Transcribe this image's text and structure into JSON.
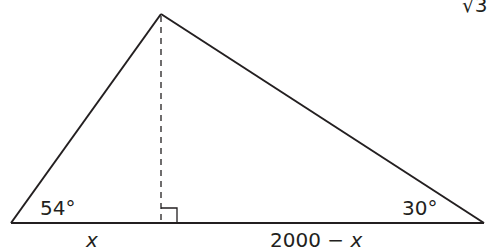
{
  "diagram": {
    "type": "triangle",
    "stroke_color": "#231f20",
    "background": "#ffffff",
    "corner_fragment": "√3",
    "vertices": {
      "apex": [
        161,
        14
      ],
      "left": [
        11,
        223
      ],
      "right": [
        484,
        223
      ],
      "foot": [
        161,
        223
      ]
    },
    "angles": {
      "left": "54°",
      "right": "30°"
    },
    "segments": {
      "left": "x",
      "right": "2000 − x"
    },
    "altitude": {
      "style": "dashed",
      "right_angle_marker": true
    }
  }
}
